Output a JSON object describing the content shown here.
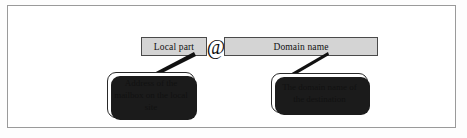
{
  "figure": {
    "name": "email-address-structure-diagram",
    "frame": {
      "border_color": "#9a9a9a"
    }
  },
  "address": {
    "separator": "@",
    "separator_icon": "at-sign-icon",
    "parts": [
      {
        "id": "local-part",
        "label": "Local part",
        "fill_color": "#d4d4d4",
        "border_color": "#4a4a4a"
      },
      {
        "id": "domain-name",
        "label": "Domain name",
        "fill_color": "#d4d4d4",
        "border_color": "#4a4a4a"
      }
    ]
  },
  "callouts": [
    {
      "id": "local-part-callout",
      "target": "local-part",
      "lines": [
        "Address of the",
        "mailbox on the",
        "local site"
      ],
      "text": "Address of the mailbox on the local site"
    },
    {
      "id": "domain-name-callout",
      "target": "domain-name",
      "lines": [
        "The domain name",
        "of the destination"
      ],
      "text": "The domain name of the destination"
    }
  ],
  "colors": {
    "box_fill": "#d4d4d4",
    "box_stroke": "#4a4a4a",
    "callout_stroke": "#2a2a2a",
    "shadow": "#1b1b1b",
    "text": "#111111",
    "page_background": "#ffffff"
  }
}
